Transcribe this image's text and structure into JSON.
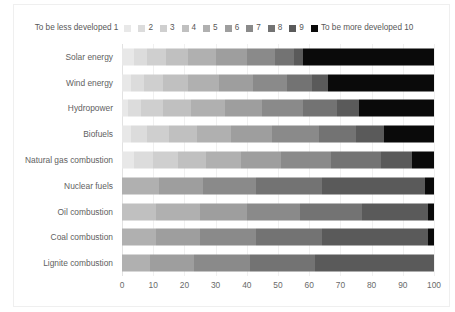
{
  "chart_data": {
    "type": "bar",
    "subtype": "horizontal-stacked",
    "title": "",
    "xlabel": "",
    "ylabel": "",
    "xlim": [
      0,
      100
    ],
    "xticks": [
      0,
      10,
      20,
      30,
      40,
      50,
      60,
      70,
      80,
      90,
      100
    ],
    "grid": true,
    "legend_position": "top",
    "legend_title_low": "To be less developed 1",
    "legend_title_high": "To be more developed 10",
    "legend": [
      {
        "label": "To be less developed 1",
        "value": 1,
        "color": "#e8e8e8"
      },
      {
        "label": "2",
        "value": 2,
        "color": "#dcdcdc"
      },
      {
        "label": "3",
        "value": 3,
        "color": "#cfcfcf"
      },
      {
        "label": "4",
        "value": 4,
        "color": "#c0c0c0"
      },
      {
        "label": "5",
        "value": 5,
        "color": "#b0b0b0"
      },
      {
        "label": "6",
        "value": 6,
        "color": "#9e9e9e"
      },
      {
        "label": "7",
        "value": 7,
        "color": "#8a8a8a"
      },
      {
        "label": "8",
        "value": 8,
        "color": "#737373"
      },
      {
        "label": "9",
        "value": 9,
        "color": "#5a5a5a"
      },
      {
        "label": "To be more developed 10",
        "value": 10,
        "color": "#0a0a0a"
      }
    ],
    "categories": [
      "Solar energy",
      "Wind energy",
      "Hydropower",
      "Biofuels",
      "Natural gas combustion",
      "Nuclear fuels",
      "Oil combustion",
      "Coal combustion",
      "Lignite combustion"
    ],
    "series": [
      {
        "name": "To be less developed 1",
        "values": [
          4,
          3,
          2,
          3,
          4,
          0,
          0,
          0,
          0
        ]
      },
      {
        "name": "2",
        "values": [
          4,
          4,
          4,
          5,
          6,
          0,
          0,
          0,
          0
        ]
      },
      {
        "name": "3",
        "values": [
          6,
          6,
          7,
          7,
          8,
          0,
          0,
          0,
          0
        ]
      },
      {
        "name": "4",
        "values": [
          7,
          8,
          9,
          9,
          9,
          0,
          11,
          0,
          0
        ]
      },
      {
        "name": "5",
        "values": [
          9,
          10,
          11,
          11,
          11,
          12,
          14,
          11,
          9
        ]
      },
      {
        "name": "6",
        "values": [
          10,
          11,
          12,
          13,
          13,
          14,
          15,
          14,
          14
        ]
      },
      {
        "name": "7",
        "values": [
          9,
          11,
          13,
          15,
          16,
          17,
          17,
          18,
          18
        ]
      },
      {
        "name": "8",
        "values": [
          6,
          8,
          11,
          12,
          16,
          21,
          20,
          21,
          21
        ]
      },
      {
        "name": "9",
        "values": [
          3,
          5,
          7,
          9,
          10,
          33,
          21,
          34,
          38
        ]
      },
      {
        "name": "To be more developed 10",
        "values": [
          42,
          34,
          24,
          16,
          7,
          3,
          2,
          2,
          0
        ]
      }
    ]
  },
  "axis": {
    "x_tick_labels": [
      "0",
      "10",
      "20",
      "30",
      "40",
      "50",
      "60",
      "70",
      "80",
      "90",
      "100"
    ]
  }
}
